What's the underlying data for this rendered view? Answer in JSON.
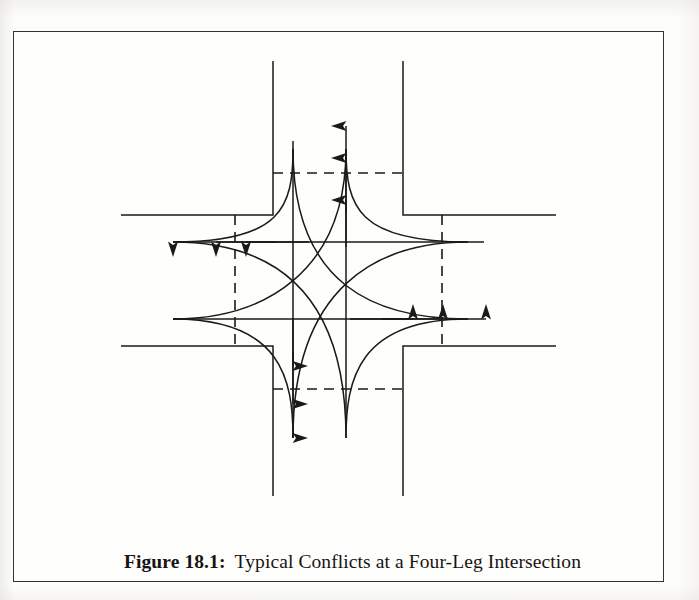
{
  "figure": {
    "caption_label": "Figure 18.1:",
    "caption_text": "Typical Conflicts at a Four-Leg Intersection",
    "frame": {
      "x": 13,
      "y": 31,
      "width": 651,
      "height": 551
    },
    "line_color": "#1c1a18",
    "frame_color": "#35332f",
    "page_background": "#fdfdfc"
  },
  "diagram": {
    "name": "four-leg-intersection-conflict-diagram",
    "type": "schematic",
    "geometry": {
      "road_edges": {
        "vertical_left_x": 272,
        "vertical_right_x": 402,
        "horizontal_top_y": 214,
        "horizontal_bottom_y": 345
      },
      "leg_extents": {
        "north_end_y": 60,
        "south_end_y": 495,
        "west_end_x": 120,
        "east_end_x": 555
      },
      "stop_bars": {
        "north_y": 172,
        "south_y": 388,
        "west_x": 234,
        "east_x": 441
      },
      "through_lanes": {
        "northbound_x": 345,
        "southbound_x": 292,
        "westbound_y": 241,
        "eastbound_y": 318
      }
    },
    "movements": [
      {
        "id": "northbound-through",
        "direction": "north",
        "arrowheads": 3
      },
      {
        "id": "southbound-through",
        "direction": "south",
        "arrowheads": 3
      },
      {
        "id": "westbound-through",
        "direction": "west",
        "arrowheads": 3
      },
      {
        "id": "eastbound-through",
        "direction": "east",
        "arrowheads": 3
      },
      {
        "id": "southbound-right-turn-to-west",
        "direction": "curve"
      },
      {
        "id": "westbound-right-turn-to-north",
        "direction": "curve"
      },
      {
        "id": "northbound-right-turn-to-east",
        "direction": "curve"
      },
      {
        "id": "eastbound-right-turn-to-south",
        "direction": "curve"
      },
      {
        "id": "southbound-left-turn-to-east",
        "direction": "curve"
      },
      {
        "id": "eastbound-left-turn-to-north",
        "direction": "curve"
      },
      {
        "id": "northbound-left-turn-to-west",
        "direction": "curve"
      },
      {
        "id": "westbound-left-turn-to-south",
        "direction": "curve"
      }
    ]
  }
}
